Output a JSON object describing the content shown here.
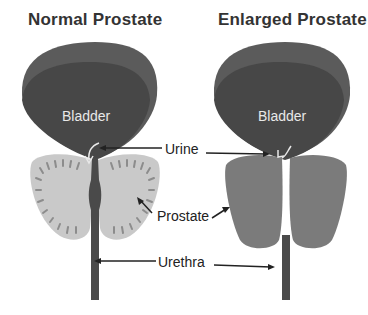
{
  "titles": {
    "normal": "Normal Prostate",
    "enlarged": "Enlarged Prostate"
  },
  "labels": {
    "bladder_left": "Bladder",
    "bladder_right": "Bladder",
    "urine": "Urine",
    "prostate": "Prostate",
    "urethra": "Urethra"
  },
  "colors": {
    "bladder_outer": "#5a5a5a",
    "bladder_inner": "#474747",
    "normal_prostate": "#c9c9c9",
    "normal_prostate_ridges": "#8f8f8f",
    "enlarged_prostate": "#7a7a7a",
    "urethra": "#4a4a4a",
    "arrow": "#222222"
  }
}
